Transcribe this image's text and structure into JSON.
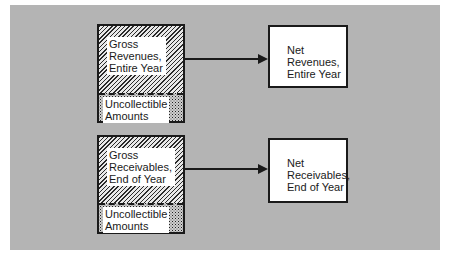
{
  "diagram": {
    "rows": [
      {
        "gross_label": "Gross\nRevenues,\nEntire Year",
        "deduction_label": "Uncollectible\nAmounts",
        "net_label": "Net\nRevenues,\nEntire Year"
      },
      {
        "gross_label": "Gross\nReceivables,\nEnd of Year",
        "deduction_label": "Uncollectible\nAmounts",
        "net_label": "Net\nReceivables,\nEnd of Year"
      }
    ]
  }
}
